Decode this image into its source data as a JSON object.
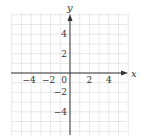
{
  "chart_data": {
    "type": "scatter",
    "title": "",
    "xlabel": "x",
    "ylabel": "y",
    "xlim": [
      -6,
      6
    ],
    "ylim": [
      -6,
      6
    ],
    "grid": true,
    "x_ticks": [
      -4,
      -2,
      0,
      2,
      4
    ],
    "x_tick_labels": [
      "−4",
      "−2",
      "0",
      "2",
      "4"
    ],
    "y_ticks": [
      4,
      2,
      -2,
      -4
    ],
    "y_tick_labels": [
      "4",
      "2",
      "−2",
      "−4"
    ],
    "series": [],
    "colors": {
      "grid": "#d9d9d9",
      "axis": "#333333",
      "text": "#333333"
    }
  }
}
